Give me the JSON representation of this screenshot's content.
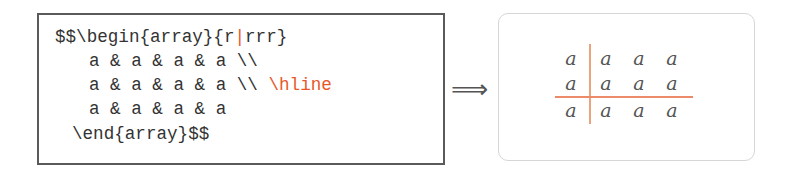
{
  "code": {
    "lines": [
      {
        "pre": "$$\\begin{array}{r",
        "highlight": "|",
        "post": "rrr}"
      },
      {
        "pre": "a & a & a & a \\\\",
        "highlight": "",
        "post": ""
      },
      {
        "pre": "a & a & a & a \\\\ ",
        "highlight": "\\hline",
        "post": ""
      },
      {
        "pre": "a & a & a & a",
        "highlight": "",
        "post": ""
      },
      {
        "pre": "\\end{array}$$",
        "highlight": "",
        "post": ""
      }
    ]
  },
  "arrow": {
    "glyph": "⟹",
    "icon": "implies-arrow-icon"
  },
  "result": {
    "rows": [
      [
        "a",
        "a",
        "a",
        "a"
      ],
      [
        "a",
        "a",
        "a",
        "a"
      ],
      [
        "a",
        "a",
        "a",
        "a"
      ]
    ],
    "column_spec": "r|rrr",
    "hline_after_row": 2
  },
  "colors": {
    "highlight": "#e8572a",
    "rule_vertical": "#e9a47f",
    "rule_horizontal": "#ec8a6a",
    "code_text": "#333333",
    "code_border": "#5a5a5a",
    "result_border": "#d6d6d6"
  }
}
